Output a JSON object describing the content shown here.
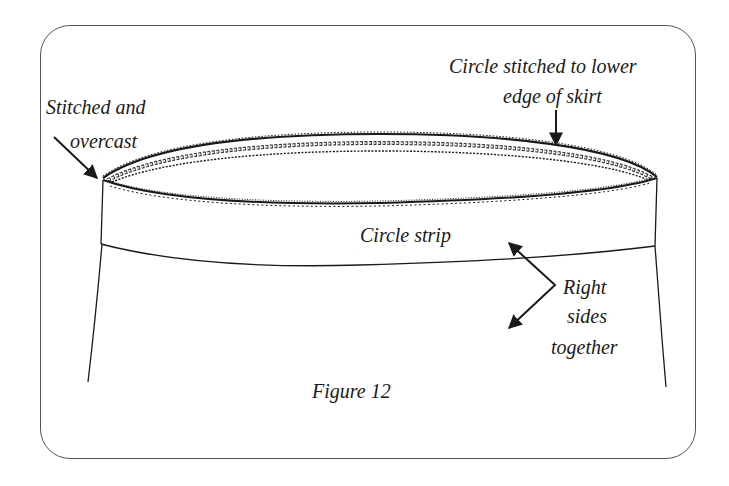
{
  "figure": {
    "caption": "Figure 12",
    "labels": {
      "stitched_line1": "Stitched and",
      "stitched_line2": "overcast",
      "circle_stitched_line1": "Circle stitched to lower",
      "circle_stitched_line2": "edge of skirt",
      "circle_strip": "Circle strip",
      "right_sides_line1": "Right",
      "right_sides_line2": "sides",
      "right_sides_line3": "together"
    }
  },
  "colors": {
    "ink": "#1a1a1a",
    "frame": "#555555",
    "background": "#ffffff"
  }
}
